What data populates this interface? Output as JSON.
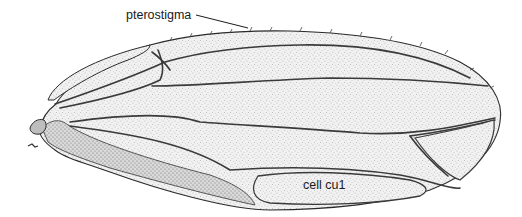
{
  "figure": {
    "labels": {
      "pterostigma": "pterostigma",
      "cell_cu1": "cell cu1"
    },
    "colors": {
      "ink": "#2a2a2a",
      "stipple": "#9a9a9a",
      "membrane": "#f3f3f3",
      "background": "#ffffff"
    }
  }
}
